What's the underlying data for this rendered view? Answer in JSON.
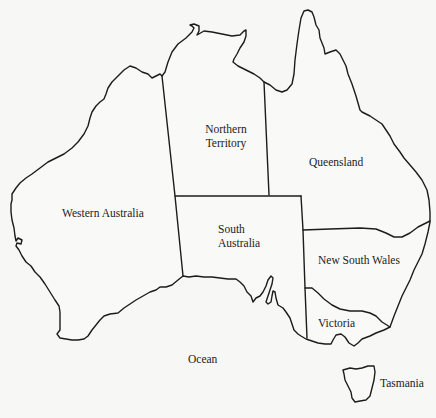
{
  "map": {
    "title": "",
    "colors": {
      "background": "#f7f7f5",
      "line": "#1c1c1c",
      "text": "#222222"
    },
    "regions": [
      {
        "id": "western-australia",
        "label": "Western Australia"
      },
      {
        "id": "northern-territory",
        "label_line1": "Northern",
        "label_line2": "Territory"
      },
      {
        "id": "queensland",
        "label": "Queensland"
      },
      {
        "id": "south-australia",
        "label_line1": "South",
        "label_line2": "Australia"
      },
      {
        "id": "new-south-wales",
        "label": "New South Wales"
      },
      {
        "id": "victoria",
        "label": "Victoria"
      },
      {
        "id": "tasmania",
        "label": "Tasmania"
      }
    ],
    "water_labels": [
      {
        "id": "ocean",
        "label": "Ocean"
      }
    ]
  }
}
